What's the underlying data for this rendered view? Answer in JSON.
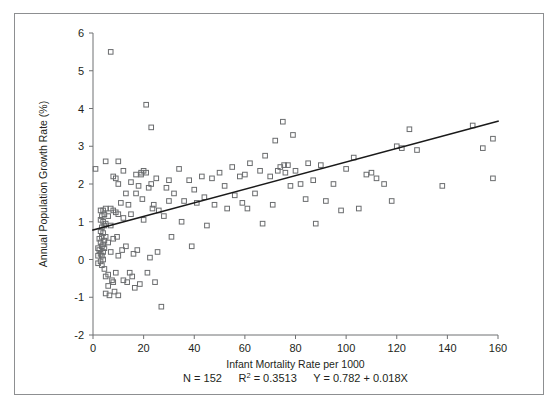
{
  "chart_data": {
    "type": "scatter",
    "title": "",
    "xlabel": "Infant Mortality Rate per 1000",
    "ylabel": "Annual Population Growth Rate (%)",
    "xlim": [
      0,
      160
    ],
    "ylim": [
      -2,
      6
    ],
    "xticks": [
      0,
      20,
      40,
      60,
      80,
      100,
      120,
      140,
      160
    ],
    "yticks": [
      -2,
      -1,
      0,
      1,
      2,
      3,
      4,
      5,
      6
    ],
    "xtick_labels": [
      "0",
      "20",
      "40",
      "60",
      "80",
      "100",
      "120",
      "140",
      "160"
    ],
    "ytick_labels": [
      "-2",
      "-1",
      "0",
      "1",
      "2",
      "3",
      "4",
      "5",
      "6"
    ],
    "grid": false,
    "legend": null,
    "marker": "open-square",
    "marker_color": "#6a6c6e",
    "line_color": "#1a1a1a",
    "annotations": {
      "n_label": "N = 152",
      "r2_label_prefix": "R",
      "r2_label_sup": "2",
      "r2_label_value": " = 0.3513",
      "equation": "Y = 0.782 + 0.018X"
    },
    "regression": {
      "intercept": 0.782,
      "slope": 0.018,
      "n": 152,
      "r_squared": 0.3513,
      "x_start": 0,
      "x_end": 160
    },
    "points": [
      [
        1.0,
        2.4
      ],
      [
        2.0,
        0.3
      ],
      [
        2.0,
        0.1
      ],
      [
        2.0,
        -0.1
      ],
      [
        2.5,
        0.55
      ],
      [
        2.5,
        0.25
      ],
      [
        3.0,
        1.3
      ],
      [
        3.0,
        1.05
      ],
      [
        3.0,
        0.75
      ],
      [
        3.0,
        0.45
      ],
      [
        3.0,
        0.15
      ],
      [
        3.0,
        -0.05
      ],
      [
        3.5,
        1.15
      ],
      [
        3.5,
        0.85
      ],
      [
        3.5,
        0.6
      ],
      [
        3.5,
        0.35
      ],
      [
        3.5,
        0.1
      ],
      [
        3.5,
        -0.15
      ],
      [
        4.0,
        1.3
      ],
      [
        4.0,
        1.0
      ],
      [
        4.0,
        0.7
      ],
      [
        4.0,
        0.4
      ],
      [
        4.0,
        0.2
      ],
      [
        4.0,
        0.0
      ],
      [
        4.5,
        1.2
      ],
      [
        4.5,
        0.9
      ],
      [
        4.5,
        0.5
      ],
      [
        4.5,
        0.3
      ],
      [
        4.5,
        -0.25
      ],
      [
        5.0,
        2.6
      ],
      [
        5.0,
        1.35
      ],
      [
        5.0,
        0.95
      ],
      [
        5.0,
        0.6
      ],
      [
        5.0,
        -0.45
      ],
      [
        5.0,
        -0.9
      ],
      [
        6.0,
        1.15
      ],
      [
        6.0,
        0.45
      ],
      [
        6.0,
        -0.4
      ],
      [
        6.0,
        -0.7
      ],
      [
        6.5,
        -0.95
      ],
      [
        7.0,
        5.5
      ],
      [
        7.0,
        1.35
      ],
      [
        7.0,
        0.9
      ],
      [
        7.0,
        0.2
      ],
      [
        7.5,
        -0.55
      ],
      [
        8.0,
        2.2
      ],
      [
        8.0,
        1.3
      ],
      [
        8.0,
        0.55
      ],
      [
        8.0,
        -0.6
      ],
      [
        8.5,
        -0.85
      ],
      [
        9.0,
        2.15
      ],
      [
        9.0,
        1.25
      ],
      [
        9.0,
        -0.35
      ],
      [
        9.5,
        0.6
      ],
      [
        10.0,
        2.6
      ],
      [
        10.0,
        2.0
      ],
      [
        10.0,
        1.2
      ],
      [
        10.0,
        0.1
      ],
      [
        10.0,
        -0.95
      ],
      [
        11.0,
        1.5
      ],
      [
        11.5,
        0.25
      ],
      [
        12.0,
        2.35
      ],
      [
        12.0,
        1.1
      ],
      [
        12.0,
        -0.55
      ],
      [
        13.0,
        1.75
      ],
      [
        13.0,
        0.35
      ],
      [
        13.5,
        -0.6
      ],
      [
        14.0,
        1.45
      ],
      [
        14.5,
        -0.35
      ],
      [
        15.0,
        2.05
      ],
      [
        15.0,
        1.2
      ],
      [
        15.5,
        -0.45
      ],
      [
        16.0,
        0.15
      ],
      [
        16.5,
        -0.75
      ],
      [
        17.0,
        2.25
      ],
      [
        17.0,
        1.75
      ],
      [
        17.5,
        0.25
      ],
      [
        18.0,
        1.95
      ],
      [
        18.5,
        -0.65
      ],
      [
        19.0,
        2.3
      ],
      [
        19.0,
        2.25
      ],
      [
        19.5,
        1.6
      ],
      [
        20.0,
        2.35
      ],
      [
        20.0,
        1.05
      ],
      [
        21.0,
        4.1
      ],
      [
        21.0,
        2.3
      ],
      [
        21.5,
        -0.35
      ],
      [
        22.0,
        1.9
      ],
      [
        22.5,
        0.05
      ],
      [
        23.0,
        3.5
      ],
      [
        23.0,
        2.0
      ],
      [
        23.5,
        1.35
      ],
      [
        24.0,
        1.45
      ],
      [
        24.5,
        -0.6
      ],
      [
        25.0,
        2.15
      ],
      [
        25.5,
        0.2
      ],
      [
        26.0,
        1.3
      ],
      [
        27.0,
        -1.25
      ],
      [
        28.0,
        1.15
      ],
      [
        29.0,
        1.9
      ],
      [
        30.0,
        2.1
      ],
      [
        30.0,
        1.55
      ],
      [
        31.0,
        0.6
      ],
      [
        32.0,
        1.75
      ],
      [
        34.0,
        2.4
      ],
      [
        35.0,
        1.0
      ],
      [
        36.0,
        1.55
      ],
      [
        38.0,
        2.1
      ],
      [
        39.0,
        0.35
      ],
      [
        40.0,
        1.85
      ],
      [
        41.0,
        1.5
      ],
      [
        43.0,
        2.2
      ],
      [
        44.0,
        1.65
      ],
      [
        45.0,
        0.9
      ],
      [
        47.0,
        2.15
      ],
      [
        48.0,
        1.45
      ],
      [
        50.0,
        2.3
      ],
      [
        52.0,
        1.95
      ],
      [
        53.0,
        1.35
      ],
      [
        55.0,
        2.45
      ],
      [
        56.0,
        1.7
      ],
      [
        58.0,
        2.2
      ],
      [
        59.0,
        1.5
      ],
      [
        60.0,
        2.25
      ],
      [
        61.0,
        1.35
      ],
      [
        62.0,
        2.55
      ],
      [
        64.0,
        1.75
      ],
      [
        66.0,
        2.35
      ],
      [
        67.0,
        0.95
      ],
      [
        68.0,
        2.75
      ],
      [
        70.0,
        2.2
      ],
      [
        71.0,
        1.45
      ],
      [
        72.0,
        3.15
      ],
      [
        73.0,
        2.35
      ],
      [
        74.0,
        2.45
      ],
      [
        75.0,
        3.65
      ],
      [
        75.5,
        2.5
      ],
      [
        76.0,
        2.3
      ],
      [
        77.0,
        2.5
      ],
      [
        78.0,
        1.95
      ],
      [
        79.0,
        3.3
      ],
      [
        80.0,
        2.35
      ],
      [
        82.0,
        2.0
      ],
      [
        84.0,
        1.6
      ],
      [
        85.0,
        2.55
      ],
      [
        87.0,
        2.1
      ],
      [
        88.0,
        0.95
      ],
      [
        90.0,
        2.5
      ],
      [
        92.0,
        1.55
      ],
      [
        95.0,
        2.0
      ],
      [
        98.0,
        1.3
      ],
      [
        100.0,
        2.4
      ],
      [
        103.0,
        2.7
      ],
      [
        105.0,
        1.35
      ],
      [
        108.0,
        2.25
      ],
      [
        110.0,
        2.3
      ],
      [
        112.0,
        2.15
      ],
      [
        115.0,
        2.0
      ],
      [
        118.0,
        1.55
      ],
      [
        120.0,
        3.0
      ],
      [
        122.0,
        2.95
      ],
      [
        125.0,
        3.45
      ],
      [
        128.0,
        2.9
      ],
      [
        138.0,
        1.95
      ],
      [
        150.0,
        3.55
      ],
      [
        154.0,
        2.95
      ],
      [
        158.0,
        3.2
      ],
      [
        158.0,
        2.15
      ]
    ]
  }
}
